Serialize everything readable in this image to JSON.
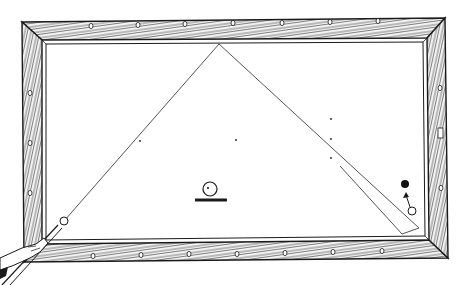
{
  "figure": {
    "colors": {
      "ink": "#1a1a1a",
      "line": "#555555",
      "cloth": "#ffffff",
      "rail_fill": "#f4f4f4"
    }
  },
  "table": {
    "outer": [
      [
        22,
        22
      ],
      [
        445,
        18
      ],
      [
        448,
        258
      ],
      [
        24,
        262
      ]
    ],
    "inner": [
      [
        42,
        40
      ],
      [
        427,
        38
      ],
      [
        429,
        240
      ],
      [
        42,
        244
      ]
    ],
    "top_diamonds": [
      [
        91,
        26
      ],
      [
        138,
        25
      ],
      [
        185,
        24
      ],
      [
        233,
        23
      ],
      [
        282,
        23
      ],
      [
        330,
        22
      ],
      [
        378,
        21
      ]
    ],
    "bottom_diamonds": [
      [
        93,
        256
      ],
      [
        141,
        255
      ],
      [
        189,
        254
      ],
      [
        237,
        254
      ],
      [
        285,
        253
      ],
      [
        333,
        252
      ],
      [
        382,
        251
      ]
    ],
    "left_diamonds": [
      [
        30,
        93
      ],
      [
        30,
        143
      ],
      [
        30,
        193
      ]
    ],
    "right_diamonds": [
      [
        440,
        88
      ],
      [
        441,
        188
      ]
    ],
    "right_marker": {
      "x": 438,
      "y": 128,
      "w": 5,
      "h": 10
    }
  },
  "shot": {
    "cue_ball": {
      "x": 64,
      "y": 221,
      "r": 4
    },
    "path": [
      [
        64,
        221
      ],
      [
        219,
        44
      ],
      [
        419,
        228
      ],
      [
        402,
        234
      ],
      [
        340,
        166
      ]
    ],
    "apex": [
      219,
      44
    ],
    "object_ball": {
      "x": 405,
      "y": 184,
      "r": 4
    },
    "target_ball": {
      "x": 412,
      "y": 211,
      "r": 4
    },
    "arrow_from": [
      410,
      207
    ],
    "arrow_to": [
      406,
      192
    ]
  },
  "markers": {
    "dots": [
      [
        140,
        141
      ],
      [
        236,
        140
      ],
      [
        331,
        119
      ],
      [
        331,
        139
      ],
      [
        331,
        158
      ]
    ],
    "legend_ball": {
      "x": 210,
      "y": 189,
      "r": 7
    },
    "legend_bar": {
      "x1": 195,
      "y1": 200,
      "x2": 227,
      "y2": 200
    }
  },
  "cue": {
    "stick": [
      [
        2,
        285
      ],
      [
        58,
        225
      ]
    ],
    "stick2": [
      [
        10,
        285
      ],
      [
        62,
        228
      ]
    ]
  }
}
